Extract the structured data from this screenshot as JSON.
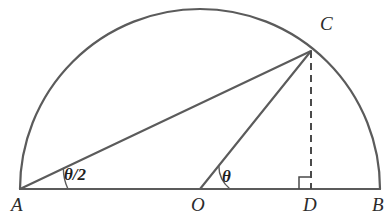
{
  "figure": {
    "type": "geometry-diagram",
    "background_color": "#ffffff",
    "line_color": "#5b5b5b",
    "dashed_line_color": "#4a4a4a",
    "label_color": "#2b2b2b"
  },
  "points": {
    "A": {
      "label": "A",
      "x": 20,
      "y": 189,
      "label_x": 11,
      "label_y": 211
    },
    "O": {
      "label": "O",
      "x": 200,
      "y": 189,
      "label_x": 191,
      "label_y": 211
    },
    "D": {
      "label": "D",
      "x": 311,
      "y": 189,
      "label_x": 303,
      "label_y": 211
    },
    "B": {
      "label": "B",
      "x": 380,
      "y": 189,
      "label_x": 372,
      "label_y": 211
    },
    "C": {
      "label": "C",
      "x": 311,
      "y": 51,
      "label_x": 320,
      "label_y": 30
    }
  },
  "angles": {
    "at_A": {
      "label": "θ/2",
      "label_x": 64,
      "label_y": 180,
      "arc_radius": 48
    },
    "at_O": {
      "label": "θ",
      "label_x": 222,
      "label_y": 182,
      "arc_radius": 30
    }
  },
  "segments": [
    {
      "name": "diameter-AB",
      "from": "A",
      "to": "B",
      "style": "solid"
    },
    {
      "name": "chord-AC",
      "from": "A",
      "to": "C",
      "style": "solid"
    },
    {
      "name": "radius-OC",
      "from": "O",
      "to": "C",
      "style": "solid"
    },
    {
      "name": "altitude-CD",
      "from": "C",
      "to": "D",
      "style": "dashed"
    }
  ],
  "arc": {
    "name": "semicircle-arc",
    "center_x": 200,
    "center_y": 189,
    "radius": 180,
    "start_angle_deg": 180,
    "end_angle_deg": 0
  },
  "right_angle_marker": {
    "name": "right-angle-at-D",
    "size": 12,
    "corner_x": 311,
    "corner_y": 189,
    "side": "left"
  }
}
